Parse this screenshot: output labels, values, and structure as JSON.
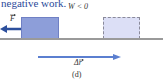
{
  "caption_top": "negative work.",
  "work_condition": "W < 0",
  "force_label": "F",
  "displacement_label": "Δr",
  "panel_label": "(d)",
  "colors": {
    "text_blue": "#2b4a9a",
    "block_fill": "#8d9ed9",
    "ghost_fill": "#dcdff6",
    "force_arrow": "#2c4f9c",
    "displacement_arrow": "#5b7fd0",
    "ground": "#9a9a9a"
  }
}
